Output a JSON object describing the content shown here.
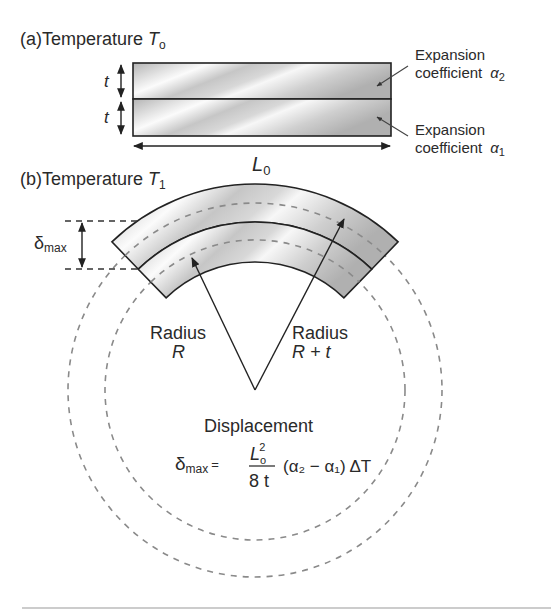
{
  "panel_a": {
    "prefix": "(a)",
    "title": "Temperature ",
    "temp_symbol": "T",
    "temp_sub": "o",
    "thickness_label_top": "t",
    "thickness_label_bottom": "t",
    "length_symbol": "L",
    "length_sub": "0",
    "layer_top": {
      "label_line1": "Expansion",
      "label_line2": "coefficient",
      "symbol": "α",
      "sub": "2"
    },
    "layer_bottom": {
      "label_line1": "Expansion",
      "label_line2": "coefficient",
      "symbol": "α",
      "sub": "1"
    }
  },
  "panel_b": {
    "prefix": "(b)",
    "title": "Temperature ",
    "temp_symbol": "T",
    "temp_sub": "1",
    "delta_symbol": "δ",
    "delta_sub": "max",
    "radius_inner": {
      "line1": "Radius",
      "line2": "R"
    },
    "radius_outer": {
      "line1": "Radius",
      "line2": "R + t"
    },
    "displacement_label": "Displacement",
    "formula": {
      "lhs_symbol": "δ",
      "lhs_sub": "max",
      "equals": "=",
      "num_symbol": "L",
      "num_sub": "o",
      "num_sup": "2",
      "denominator": "8 t",
      "rest": "(α₂ − α₁) ΔT"
    }
  },
  "colors": {
    "stroke": "#222222",
    "dash": "#8a8a8a",
    "metal_light": "#f4f4f4",
    "metal_dark": "#a9a9a9",
    "rule": "#9a9a9a"
  }
}
